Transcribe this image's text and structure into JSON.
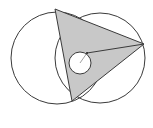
{
  "diagram": {
    "colors": {
      "stroke": "#3a3a3a",
      "fill_triangle": "#c8c8c8",
      "fill_inner_circle": "#ffffff",
      "background": "#ffffff"
    },
    "left_circle": {
      "cx": 57,
      "cy": 58,
      "r": 46
    },
    "right_circle": {
      "cx": 100,
      "cy": 58,
      "r": 45
    },
    "triangle": {
      "points": "55,9 144,44 72,101"
    },
    "inner_circle": {
      "cx": 80,
      "cy": 63,
      "r": 11
    },
    "tangent_line": {
      "x1": 87,
      "y1": 53,
      "x2": 144,
      "y2": 44
    },
    "radius_line": {
      "x1": 80,
      "y1": 63,
      "x2": 87,
      "y2": 53
    }
  }
}
